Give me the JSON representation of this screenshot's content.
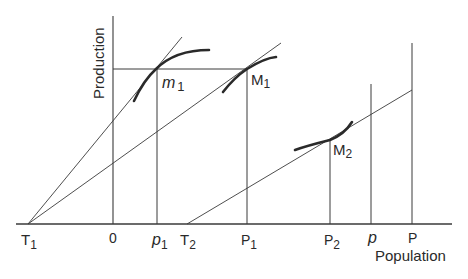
{
  "diagram": {
    "axes": {
      "y_label": "Production",
      "x_label": "Population",
      "origin_label": "0"
    },
    "x_tick_labels": [
      {
        "id": "T1",
        "main": "T",
        "sub": "1",
        "italic": false
      },
      {
        "id": "0",
        "main": "0",
        "sub": "",
        "italic": false
      },
      {
        "id": "p1",
        "main": "p",
        "sub": "1",
        "italic": true
      },
      {
        "id": "T2",
        "main": "T",
        "sub": "2",
        "italic": false
      },
      {
        "id": "P1",
        "main": "P",
        "sub": "1",
        "italic": false
      },
      {
        "id": "P2",
        "main": "P",
        "sub": "2",
        "italic": false
      },
      {
        "id": "p",
        "main": "p",
        "sub": "",
        "italic": true
      },
      {
        "id": "P",
        "main": "P",
        "sub": "",
        "italic": false
      }
    ],
    "point_labels": [
      {
        "id": "m1",
        "main": "m",
        "sub": "1",
        "italic": true
      },
      {
        "id": "M1",
        "main": "M",
        "sub": "1",
        "italic": false
      },
      {
        "id": "M2",
        "main": "M",
        "sub": "2",
        "italic": false
      }
    ],
    "colors": {
      "line": "#3a3a3a",
      "curve": "#2a2a2a",
      "background": "#ffffff"
    }
  }
}
